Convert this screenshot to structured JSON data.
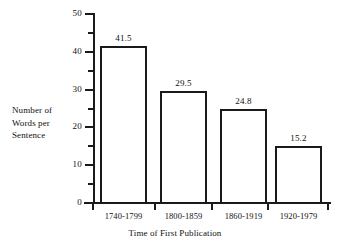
{
  "chart_data": {
    "type": "bar",
    "title": "",
    "categories": [
      "1740-1799",
      "1800-1859",
      "1860-1919",
      "1920-1979"
    ],
    "values": [
      41.5,
      29.5,
      24.8,
      15.2
    ],
    "value_labels": [
      "41.5",
      "29.5",
      "24.8",
      "15.2"
    ],
    "xlabel": "Time of First Publication",
    "ylabel": "Number of Words per Sentence",
    "ylabel_lines": [
      "Number of",
      "Words per",
      "Sentence"
    ],
    "ylim": [
      0,
      50
    ],
    "y_major_ticks": [
      0,
      10,
      20,
      30,
      40,
      50
    ],
    "y_major_tick_labels": [
      "0",
      "10",
      "20",
      "30",
      "40",
      "50"
    ],
    "y_minor_ticks": [
      5,
      15,
      25,
      35,
      45
    ],
    "grid": false,
    "legend": false,
    "bar_fill": "#ffffff",
    "bar_outline": "#1a1a1a",
    "background": "#ffffff"
  }
}
